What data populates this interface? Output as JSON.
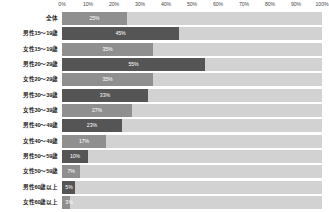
{
  "chart_data": {
    "type": "bar",
    "orientation": "horizontal",
    "title": "",
    "xlabel": "",
    "ylabel": "",
    "xlim": [
      0,
      100
    ],
    "grid": false,
    "legend": null,
    "axis_ticks": [
      "0%",
      "10%",
      "20%",
      "30%",
      "40%",
      "50%",
      "60%",
      "70%",
      "80%",
      "90%",
      "100%"
    ],
    "axis_tick_values": [
      0,
      10,
      20,
      30,
      40,
      50,
      60,
      70,
      80,
      90,
      100
    ],
    "categories": [
      "全体",
      "男性15～19歳",
      "女性15～19歳",
      "男性20～29歳",
      "女性20～29歳",
      "男性30～39歳",
      "女性30～39歳",
      "男性40～49歳",
      "女性40～49歳",
      "男性50～59歳",
      "女性50～59歳",
      "男性60歳以上",
      "女性60歳以上"
    ],
    "values": [
      25,
      45,
      35,
      55,
      35,
      33,
      27,
      23,
      17,
      10,
      7,
      5,
      3
    ],
    "value_labels": [
      "25%",
      "45%",
      "35%",
      "55%",
      "35%",
      "33%",
      "27%",
      "23%",
      "17%",
      "10%",
      "7%",
      "5%",
      "3%"
    ],
    "series_groups": [
      "total",
      "male",
      "female",
      "male",
      "female",
      "male",
      "female",
      "male",
      "female",
      "male",
      "female",
      "male",
      "female"
    ]
  },
  "colors": {
    "male_bar": "#555555",
    "female_bar": "#8f8f8f",
    "total_bar": "#8f8f8f",
    "track": "#d2d2d2",
    "axis_rule": "#9a9a9a",
    "label_text": "#1c1c1c",
    "tick_text": "#4a4a4a",
    "value_text": "#ffffff",
    "background": "#ffffff"
  }
}
